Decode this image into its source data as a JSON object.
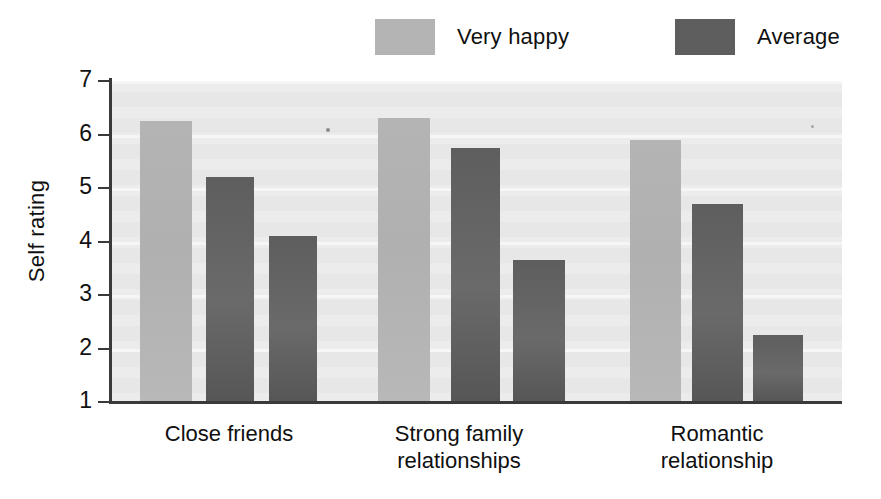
{
  "chart_data": {
    "type": "bar",
    "title": "",
    "xlabel": "",
    "ylabel": "Self rating",
    "ylim": [
      1,
      7
    ],
    "ytick_labels": [
      "7",
      "6",
      "5",
      "4",
      "3",
      "2",
      "1"
    ],
    "ytick_values": [
      7,
      6,
      5,
      4,
      3,
      2,
      1
    ],
    "grid": true,
    "legend_position": "top",
    "categories": [
      "Close friends",
      "Strong family relationships",
      "Romantic relationship"
    ],
    "category_lines": [
      [
        "Close friends"
      ],
      [
        "Strong family",
        "relationships"
      ],
      [
        "Romantic",
        "relationship"
      ]
    ],
    "series": [
      {
        "name": "Very happy",
        "color": "#b4b4b4",
        "values": [
          6.25,
          6.3,
          5.9
        ]
      },
      {
        "name": "Average",
        "color": "#5e5e5e",
        "values": [
          5.2,
          5.75,
          4.7
        ]
      },
      {
        "name": "Average",
        "color": "#5e5e5e",
        "values": [
          4.1,
          3.65,
          2.25
        ]
      }
    ],
    "bars": [
      {
        "group": "Close friends",
        "series": "Very happy",
        "value": 6.25,
        "shade": "light"
      },
      {
        "group": "Close friends",
        "series": "Average",
        "value": 5.2,
        "shade": "dark"
      },
      {
        "group": "Close friends",
        "series": "Average",
        "value": 4.1,
        "shade": "dark"
      },
      {
        "group": "Strong family relationships",
        "series": "Very happy",
        "value": 6.3,
        "shade": "light"
      },
      {
        "group": "Strong family relationships",
        "series": "Average",
        "value": 5.75,
        "shade": "dark"
      },
      {
        "group": "Strong family relationships",
        "series": "Average",
        "value": 3.65,
        "shade": "dark"
      },
      {
        "group": "Romantic relationship",
        "series": "Very happy",
        "value": 5.9,
        "shade": "light"
      },
      {
        "group": "Romantic relationship",
        "series": "Average",
        "value": 4.7,
        "shade": "dark"
      },
      {
        "group": "Romantic relationship",
        "series": "Average",
        "value": 2.25,
        "shade": "dark"
      }
    ]
  },
  "legend": {
    "items": [
      {
        "label": "Very happy",
        "color": "#b4b4b4",
        "swatch_name": "legend-swatch-very-happy"
      },
      {
        "label": "Average",
        "color": "#5e5e5e",
        "swatch_name": "legend-swatch-average"
      }
    ]
  },
  "axis": {
    "y_title": "Self rating",
    "y_ticks": [
      "7",
      "6",
      "5",
      "4",
      "3",
      "2",
      "1"
    ]
  },
  "colors": {
    "plot_background": "#e7e7e7",
    "axis": "#3a3a3a",
    "light_bar": "#b4b4b4",
    "dark_bar": "#5e5e5e",
    "page_background": "#ffffff",
    "text": "#111111"
  }
}
